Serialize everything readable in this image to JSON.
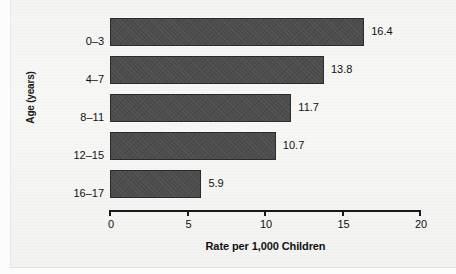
{
  "chart_data": {
    "type": "bar",
    "orientation": "horizontal",
    "title": "",
    "xlabel": "Rate per 1,000 Children",
    "ylabel": "Age (years)",
    "categories": [
      "0–3",
      "4–7",
      "8–11",
      "12–15",
      "16–17"
    ],
    "values": [
      16.4,
      13.8,
      11.7,
      10.7,
      5.9
    ],
    "value_labels": [
      "16.4",
      "13.8",
      "11.7",
      "10.7",
      "5.9"
    ],
    "xlim": [
      0,
      20
    ],
    "xticks": [
      0,
      5,
      10,
      15,
      20
    ],
    "xtick_labels": [
      "0",
      "5",
      "10",
      "15",
      "20"
    ],
    "grid": false,
    "legend": false,
    "legend_position": "none",
    "bar_color": "#4c4c4c",
    "bar_border_color": "#2b2b2b",
    "axis_color": "#1a1a1a",
    "text_color": "#111111",
    "background_color": "#f7f7f6"
  }
}
